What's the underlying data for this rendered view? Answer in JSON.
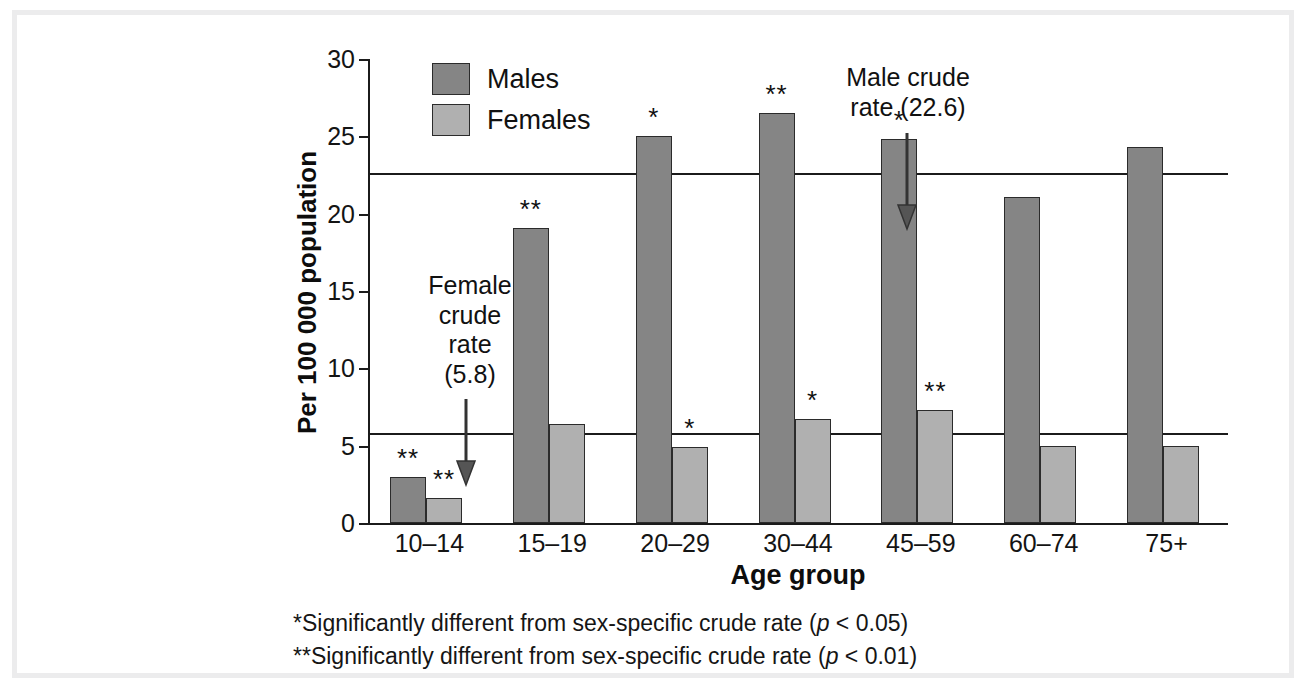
{
  "chart_data": {
    "type": "bar",
    "title": "",
    "xlabel": "Age group",
    "ylabel": "Per 100 000 population",
    "categories": [
      "10–14",
      "15–19",
      "20–29",
      "30–44",
      "45–59",
      "60–74",
      "75+"
    ],
    "series": [
      {
        "name": "Males",
        "color": "#858585",
        "values": [
          3.0,
          19.1,
          25.0,
          26.5,
          24.8,
          21.1,
          24.3
        ],
        "significance": [
          "**",
          "**",
          "*",
          "**",
          "*",
          "",
          ""
        ]
      },
      {
        "name": "Females",
        "color": "#b0b0b0",
        "values": [
          1.6,
          6.4,
          4.9,
          6.7,
          7.3,
          5.0,
          5.0
        ],
        "significance": [
          "**",
          "",
          "*",
          "*",
          "**",
          "",
          ""
        ]
      }
    ],
    "ylim": [
      0,
      30
    ],
    "yticks": [
      0,
      5,
      10,
      15,
      20,
      25,
      30
    ],
    "ytick_labels": [
      "0",
      "5",
      "10",
      "15",
      "20",
      "25",
      "30"
    ],
    "grid": false,
    "legend_position": "top-left",
    "reference_lines": [
      {
        "label": "Male crude rate",
        "value": 22.6,
        "annotation": "Male crude\nrate (22.6)"
      },
      {
        "label": "Female crude rate",
        "value": 5.8,
        "annotation": "Female\ncrude\nrate\n(5.8)"
      }
    ],
    "annotations": [
      {
        "name": "male-crude-rate-note",
        "text": "Male crude\nrate (22.6)"
      },
      {
        "name": "female-crude-rate-note",
        "text": "Female\ncrude\nrate\n(5.8)"
      }
    ]
  },
  "legend": {
    "items": [
      {
        "label": "Males",
        "color": "#858585"
      },
      {
        "label": "Females",
        "color": "#b0b0b0"
      }
    ]
  },
  "footnotes": {
    "line1_prefix": "*Significantly different from sex-specific crude rate (",
    "line1_italic": "p",
    "line1_suffix": " < 0.05)",
    "line2_prefix": "**Significantly different from sex-specific crude rate (",
    "line2_italic": "p",
    "line2_suffix": " < 0.01)"
  }
}
